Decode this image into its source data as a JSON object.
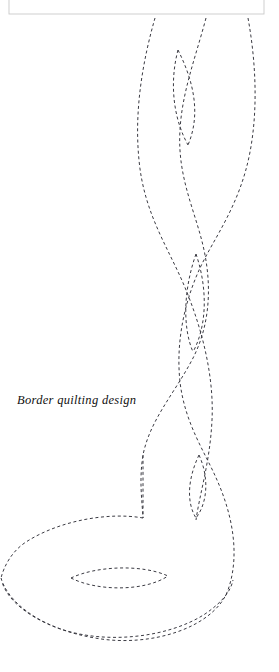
{
  "page": {
    "width": 279,
    "height": 672,
    "background_color": "#ffffff"
  },
  "caption": {
    "text": "Border quilting design",
    "style": "italic",
    "color": "#111111",
    "x": 17,
    "y": 394
  },
  "frame": {
    "name": "top-border-box",
    "stroke_color": "#c9c9c9",
    "x": 9,
    "y": -40,
    "width": 255,
    "height": 54
  },
  "stitching": {
    "stroke_color": "#3a3a42",
    "stroke_width": 1,
    "dash_on": 3,
    "dash_off": 2.6,
    "description": "dashed stitch lines forming an interlaced braid border with pointed leaf motifs"
  },
  "paths": {
    "braid_left_strand": "M155,18 C143,60 134,110 139,160 C144,215 170,250 186,290 C204,334 214,380 212,420 C210,462 200,492 196,520",
    "braid_right_strand": "M248,18 C256,62 258,110 250,152 C240,205 214,238 200,268 C183,305 176,345 180,382 C185,424 205,452 217,480 C233,516 240,556 228,590 C214,628 150,648 95,638 C48,630 10,608 2,582",
    "braid_mid_strand": "M206,18 C196,56 182,92 180,130 C177,178 196,212 204,250 C213,292 208,330 192,360 C174,394 150,420 143,455 C139,480 142,500 143,518",
    "stem_vertical": "M143,455 C143,480 143,500 143,518",
    "big_leaf_upper": "M143,518 C110,512 60,520 26,542 C12,551 4,566 1,578",
    "big_leaf_lower": "M1,578 C6,596 26,616 58,628 C104,645 168,638 205,614 C224,601 231,590 233,580",
    "inner_leaf_top": "M178,50 C170,80 172,116 188,145",
    "inner_leaf_top_b": "M178,50 C192,78 202,112 188,145",
    "inner_leaf_mid": "M196,254 C184,288 182,326 193,352",
    "inner_leaf_mid_b": "M196,254 C207,286 208,324 193,352",
    "inner_leaf_low": "M199,455 C188,478 186,502 196,518",
    "inner_leaf_low_b": "M199,455 C209,477 208,502 196,518",
    "inner_leaf_bottom": "M71,578 C96,566 142,564 168,576",
    "inner_leaf_bottom_b": "M71,578 C96,591 144,592 168,576"
  }
}
